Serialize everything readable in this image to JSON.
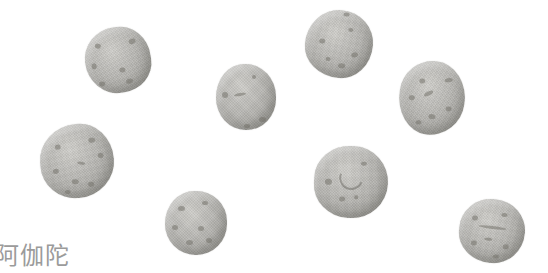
{
  "image_type": "photograph-of-round-pills",
  "caption": {
    "text": "阿伽陀"
  },
  "colors": {
    "background": "#ffffff",
    "pill_base": "#b5b4b0",
    "pill_highlight": "#d0cfcb",
    "pill_shadow": "#908e87",
    "speckle": "#6f6d66",
    "caption_text": "#9b9b9b"
  },
  "pills": [
    {
      "id": 1,
      "cx": 118,
      "cy": 60,
      "rx": 33,
      "ry": 33,
      "rot": -8,
      "shape": "52% 48% 50% 50% / 50% 52% 46% 54%",
      "marks": [
        {
          "dx": -18,
          "dy": -17,
          "w": 6,
          "h": 5,
          "rot": 20
        },
        {
          "dx": 16,
          "dy": -17,
          "w": 7,
          "h": 5,
          "rot": -15
        },
        {
          "dx": -25,
          "dy": 3,
          "w": 5,
          "h": 6,
          "rot": 0
        },
        {
          "dx": 3,
          "dy": 10,
          "w": 6,
          "h": 5,
          "rot": 0
        },
        {
          "dx": -19,
          "dy": 21,
          "w": 6,
          "h": 5,
          "rot": 10
        },
        {
          "dx": 8,
          "dy": 22,
          "w": 7,
          "h": 5,
          "rot": -10
        }
      ]
    },
    {
      "id": 2,
      "cx": 339,
      "cy": 44,
      "rx": 34,
      "ry": 34,
      "rot": 5,
      "shape": "50% 50% 46% 54% / 54% 48% 52% 46%",
      "marks": [
        {
          "dx": -17,
          "dy": -2,
          "w": 6,
          "h": 5,
          "rot": 0
        },
        {
          "dx": 10,
          "dy": -15,
          "w": 5,
          "h": 4,
          "rot": 0
        },
        {
          "dx": 16,
          "dy": 9,
          "w": 7,
          "h": 5,
          "rot": -20
        },
        {
          "dx": 4,
          "dy": 21,
          "w": 7,
          "h": 5,
          "rot": 0
        },
        {
          "dx": -10,
          "dy": 16,
          "w": 5,
          "h": 4,
          "rot": 0
        },
        {
          "dx": 5,
          "dy": -30,
          "w": 6,
          "h": 4,
          "rot": 0
        }
      ]
    },
    {
      "id": 3,
      "cx": 246,
      "cy": 97,
      "rx": 30,
      "ry": 33,
      "rot": 0,
      "shape": "48% 52% 50% 50% / 52% 50% 48% 50%",
      "marks": [
        {
          "dx": -21,
          "dy": -2,
          "w": 6,
          "h": 6,
          "rot": 0
        },
        {
          "dx": -6,
          "dy": -3,
          "w": 12,
          "h": 3,
          "rot": -10
        },
        {
          "dx": 16,
          "dy": 22,
          "w": 7,
          "h": 5,
          "rot": 0
        },
        {
          "dx": 1,
          "dy": 29,
          "w": 6,
          "h": 4,
          "rot": 0
        },
        {
          "dx": 8,
          "dy": -20,
          "w": 4,
          "h": 4,
          "rot": 0
        }
      ]
    },
    {
      "id": 4,
      "cx": 432,
      "cy": 98,
      "rx": 33,
      "ry": 37,
      "rot": 8,
      "shape": "50% 50% 52% 48% / 46% 52% 48% 54%",
      "marks": [
        {
          "dx": -12,
          "dy": -16,
          "w": 6,
          "h": 5,
          "rot": 0
        },
        {
          "dx": 14,
          "dy": -20,
          "w": 8,
          "h": 4,
          "rot": -15
        },
        {
          "dx": -20,
          "dy": 2,
          "w": 6,
          "h": 5,
          "rot": 0
        },
        {
          "dx": -4,
          "dy": -4,
          "w": 10,
          "h": 4,
          "rot": -35
        },
        {
          "dx": 18,
          "dy": 8,
          "w": 6,
          "h": 5,
          "rot": 0
        },
        {
          "dx": 2,
          "dy": 18,
          "w": 7,
          "h": 5,
          "rot": 0
        },
        {
          "dx": -10,
          "dy": 26,
          "w": 6,
          "h": 4,
          "rot": 0
        }
      ]
    },
    {
      "id": 5,
      "cx": 77,
      "cy": 161,
      "rx": 37,
      "ry": 37,
      "rot": -5,
      "shape": "54% 46% 52% 48% / 50% 52% 50% 48%",
      "marks": [
        {
          "dx": -18,
          "dy": -16,
          "w": 6,
          "h": 5,
          "rot": 0
        },
        {
          "dx": 16,
          "dy": -20,
          "w": 7,
          "h": 5,
          "rot": 0
        },
        {
          "dx": 24,
          "dy": -4,
          "w": 6,
          "h": 5,
          "rot": 0
        },
        {
          "dx": -22,
          "dy": 8,
          "w": 6,
          "h": 5,
          "rot": 0
        },
        {
          "dx": -4,
          "dy": 20,
          "w": 7,
          "h": 5,
          "rot": 0
        },
        {
          "dx": 12,
          "dy": 24,
          "w": 6,
          "h": 5,
          "rot": 0
        },
        {
          "dx": -12,
          "dy": 30,
          "w": 6,
          "h": 4,
          "rot": 0
        },
        {
          "dx": 4,
          "dy": 2,
          "w": 8,
          "h": 3,
          "rot": 15
        }
      ]
    },
    {
      "id": 6,
      "cx": 351,
      "cy": 182,
      "rx": 37,
      "ry": 36,
      "rot": 3,
      "shape": "50% 50% 50% 50% / 48% 52% 52% 48%",
      "marks": [
        {
          "dx": -23,
          "dy": 1,
          "w": 7,
          "h": 6,
          "rot": 0
        },
        {
          "dx": -8,
          "dy": 17,
          "w": 6,
          "h": 5,
          "rot": 0
        },
        {
          "dx": 6,
          "dy": 15,
          "w": 4,
          "h": 4,
          "rot": 0
        },
        {
          "dx": 12,
          "dy": -19,
          "w": 6,
          "h": 4,
          "rot": 0
        },
        {
          "dx": -2,
          "dy": -6,
          "w": 20,
          "h": 20,
          "rot": -25,
          "arc": true
        }
      ]
    },
    {
      "id": 7,
      "cx": 196,
      "cy": 223,
      "rx": 31,
      "ry": 32,
      "rot": 0,
      "shape": "49% 51% 50% 50% / 52% 48% 50% 50%",
      "marks": [
        {
          "dx": -15,
          "dy": -15,
          "w": 7,
          "h": 5,
          "rot": 0
        },
        {
          "dx": 9,
          "dy": -20,
          "w": 6,
          "h": 4,
          "rot": 0
        },
        {
          "dx": -21,
          "dy": 4,
          "w": 6,
          "h": 5,
          "rot": 0
        },
        {
          "dx": 5,
          "dy": 5,
          "w": 6,
          "h": 5,
          "rot": 0
        },
        {
          "dx": -7,
          "dy": 19,
          "w": 7,
          "h": 5,
          "rot": 0
        },
        {
          "dx": 13,
          "dy": 17,
          "w": 6,
          "h": 5,
          "rot": 0
        }
      ]
    },
    {
      "id": 8,
      "cx": 492,
      "cy": 231,
      "rx": 33,
      "ry": 32,
      "rot": 5,
      "shape": "50% 50% 48% 52% / 50% 50% 52% 48%",
      "marks": [
        {
          "dx": -18,
          "dy": -12,
          "w": 6,
          "h": 5,
          "rot": 0
        },
        {
          "dx": 11,
          "dy": -17,
          "w": 6,
          "h": 4,
          "rot": 0
        },
        {
          "dx": -17,
          "dy": 13,
          "w": 6,
          "h": 5,
          "rot": 0
        },
        {
          "dx": 15,
          "dy": 14,
          "w": 6,
          "h": 5,
          "rot": 0
        },
        {
          "dx": 6,
          "dy": 25,
          "w": 6,
          "h": 4,
          "rot": 0
        },
        {
          "dx": 0,
          "dy": -4,
          "w": 28,
          "h": 3,
          "rot": 2
        },
        {
          "dx": -3,
          "dy": 8,
          "w": 8,
          "h": 3,
          "rot": 0
        }
      ]
    }
  ]
}
